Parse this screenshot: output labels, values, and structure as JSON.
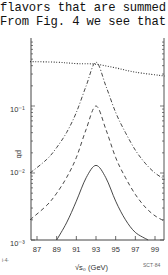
{
  "text": {
    "line1": "flavors that are summed ove",
    "line2": "From Fig. 4 we see that"
  },
  "chart_data": {
    "type": "line",
    "title": "",
    "xlabel": "√s₀ (GeV)",
    "ylabel": "pb",
    "xscale": "linear",
    "yscale": "log",
    "xlim": [
      86.3,
      100
    ],
    "ylim": [
      0.001,
      1
    ],
    "x_ticks": [
      "87",
      "89",
      "91",
      "93",
      "95",
      "97",
      "99"
    ],
    "y_ticks": [
      "10⁻³",
      "10⁻²",
      "10⁻¹"
    ],
    "grid": false,
    "legend": null,
    "annotations": [
      "SCT-84",
      "(left corner mark)"
    ],
    "series": [
      {
        "name": "dotted",
        "style": "dotted",
        "x": [
          86.3,
          89,
          91,
          93,
          95,
          97,
          100
        ],
        "y": [
          0.46,
          0.45,
          0.43,
          0.42,
          0.37,
          0.32,
          0.28
        ]
      },
      {
        "name": "dash-dot",
        "style": "dash-dot",
        "x": [
          86.3,
          88,
          89,
          90,
          91,
          92,
          93,
          94,
          95,
          96,
          97,
          98,
          99,
          100
        ],
        "y": [
          0.01,
          0.016,
          0.024,
          0.04,
          0.08,
          0.2,
          0.45,
          0.2,
          0.08,
          0.04,
          0.022,
          0.014,
          0.01,
          0.008
        ]
      },
      {
        "name": "dashed",
        "style": "dashed",
        "x": [
          86.3,
          88,
          89,
          90,
          91,
          92,
          93,
          94,
          95,
          96,
          97,
          98,
          99,
          100
        ],
        "y": [
          0.002,
          0.0033,
          0.005,
          0.0085,
          0.017,
          0.045,
          0.1,
          0.045,
          0.017,
          0.0085,
          0.0048,
          0.0031,
          0.0023,
          0.0019
        ]
      },
      {
        "name": "solid",
        "style": "solid",
        "x": [
          89,
          90,
          91,
          92,
          93,
          94,
          95,
          96,
          97,
          98.3
        ],
        "y": [
          0.001,
          0.0018,
          0.0038,
          0.0085,
          0.013,
          0.0085,
          0.0038,
          0.002,
          0.0013,
          0.001
        ]
      }
    ]
  },
  "axis": {
    "xlabel": "√s₀  (GeV)",
    "ylabel": "pb",
    "corner_left": "i·4·",
    "corner_right": "SCT·84"
  }
}
